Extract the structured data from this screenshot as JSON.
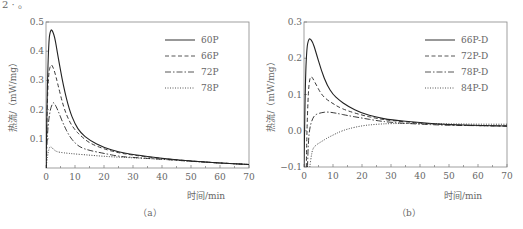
{
  "page": {
    "top_fragment": "2 ·  。"
  },
  "chart_data": [
    {
      "id": "a",
      "type": "line",
      "caption": "（a）",
      "title": "",
      "xlabel": "时间/min",
      "ylabel": "热流/（mW/mg）",
      "xlim": [
        0,
        70
      ],
      "ylim": [
        0.0,
        0.5
      ],
      "xticks": [
        0,
        10,
        20,
        30,
        40,
        50,
        60,
        70
      ],
      "yticks": [
        0.1,
        0.2,
        0.3,
        0.4,
        0.5
      ],
      "ytick_labels": [
        "0.1",
        "0.2",
        "0.3",
        "0.4",
        "0.5"
      ],
      "grid": false,
      "legend_position": "upper right",
      "series": [
        {
          "name": "60P",
          "style": "solid",
          "x": [
            0,
            0.5,
            1,
            1.5,
            2,
            3,
            4,
            6,
            8,
            10,
            12,
            15,
            20,
            25,
            30,
            40,
            50,
            60,
            70
          ],
          "y": [
            0.0,
            0.3,
            0.44,
            0.47,
            0.475,
            0.45,
            0.39,
            0.28,
            0.2,
            0.15,
            0.12,
            0.095,
            0.07,
            0.055,
            0.046,
            0.033,
            0.024,
            0.017,
            0.012
          ]
        },
        {
          "name": "66P",
          "style": "dashed",
          "x": [
            0,
            0.5,
            1,
            1.5,
            2,
            3,
            4,
            6,
            8,
            10,
            12,
            15,
            20,
            25,
            30,
            40,
            50,
            60,
            70
          ],
          "y": [
            0.0,
            0.25,
            0.33,
            0.35,
            0.355,
            0.33,
            0.29,
            0.21,
            0.16,
            0.13,
            0.11,
            0.085,
            0.065,
            0.052,
            0.044,
            0.032,
            0.024,
            0.017,
            0.012
          ]
        },
        {
          "name": "72P",
          "style": "dashdot",
          "x": [
            0,
            0.5,
            1,
            1.5,
            2,
            2.5,
            3,
            4,
            6,
            8,
            10,
            12,
            15,
            20,
            25,
            30,
            40,
            50,
            60,
            70
          ],
          "y": [
            0.0,
            0.12,
            0.17,
            0.2,
            0.215,
            0.225,
            0.22,
            0.2,
            0.15,
            0.11,
            0.085,
            0.07,
            0.06,
            0.05,
            0.04,
            0.036,
            0.03,
            0.023,
            0.017,
            0.012
          ]
        },
        {
          "name": "78P",
          "style": "dotted",
          "x": [
            0,
            0.5,
            1,
            1.5,
            2,
            3,
            4,
            6,
            10,
            15,
            20,
            25,
            30,
            40,
            50,
            60,
            70
          ],
          "y": [
            0.0,
            0.04,
            0.065,
            0.075,
            0.07,
            0.06,
            0.055,
            0.052,
            0.048,
            0.044,
            0.04,
            0.037,
            0.035,
            0.03,
            0.023,
            0.017,
            0.012
          ]
        }
      ]
    },
    {
      "id": "b",
      "type": "line",
      "caption": "（b）",
      "title": "",
      "xlabel": "时间/min",
      "ylabel": "热流/（mW/mg）",
      "xlim": [
        0,
        70
      ],
      "ylim": [
        -0.1,
        0.3
      ],
      "xticks": [
        0,
        10,
        20,
        30,
        40,
        50,
        60,
        70
      ],
      "yticks": [
        -0.1,
        0.0,
        0.1,
        0.2,
        0.3
      ],
      "ytick_labels": [
        "−0.1",
        "0.0",
        "0.1",
        "0.2",
        "0.3"
      ],
      "grid": false,
      "legend_position": "upper right",
      "series": [
        {
          "name": "66P-D",
          "style": "solid",
          "x": [
            0,
            0.5,
            1,
            1.5,
            2,
            3,
            4,
            6,
            8,
            10,
            12,
            15,
            20,
            25,
            30,
            40,
            50,
            60,
            70
          ],
          "y": [
            -0.1,
            0.15,
            0.23,
            0.25,
            0.255,
            0.245,
            0.22,
            0.165,
            0.125,
            0.1,
            0.085,
            0.068,
            0.048,
            0.037,
            0.03,
            0.022,
            0.017,
            0.015,
            0.013
          ]
        },
        {
          "name": "72P-D",
          "style": "dashed",
          "x": [
            0.8,
            1,
            1.5,
            2,
            2.5,
            3,
            4,
            6,
            8,
            10,
            12,
            15,
            20,
            25,
            30,
            40,
            50,
            60,
            70
          ],
          "y": [
            -0.1,
            0.0,
            0.11,
            0.145,
            0.15,
            0.145,
            0.13,
            0.1,
            0.085,
            0.075,
            0.065,
            0.055,
            0.043,
            0.034,
            0.028,
            0.021,
            0.016,
            0.014,
            0.013
          ]
        },
        {
          "name": "78P-D",
          "style": "dashdot",
          "x": [
            1.2,
            1.5,
            2,
            3,
            4,
            6,
            8,
            10,
            12,
            15,
            20,
            25,
            30,
            40,
            50,
            60,
            70
          ],
          "y": [
            -0.1,
            -0.03,
            0.01,
            0.035,
            0.045,
            0.05,
            0.052,
            0.05,
            0.047,
            0.042,
            0.035,
            0.028,
            0.023,
            0.018,
            0.015,
            0.014,
            0.013
          ]
        },
        {
          "name": "84P-D",
          "style": "dotted",
          "x": [
            2,
            2.5,
            3,
            4,
            6,
            8,
            10,
            12,
            15,
            20,
            25,
            30,
            40,
            50,
            60,
            70
          ],
          "y": [
            -0.1,
            -0.07,
            -0.05,
            -0.04,
            -0.03,
            -0.02,
            -0.012,
            -0.004,
            0.005,
            0.014,
            0.018,
            0.02,
            0.02,
            0.019,
            0.018,
            0.018
          ]
        }
      ]
    }
  ]
}
